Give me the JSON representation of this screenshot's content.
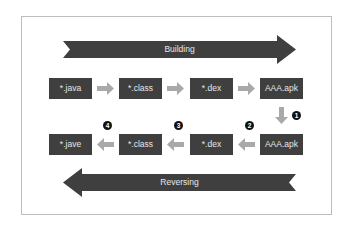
{
  "diagram": {
    "building_label": "Building",
    "reversing_label": "Reversing",
    "build_row": [
      {
        "label": "*.java"
      },
      {
        "label": "*.class"
      },
      {
        "label": "*.dex"
      },
      {
        "label": "AAA.apk"
      }
    ],
    "reverse_row": [
      {
        "label": "*.jave"
      },
      {
        "label": "*.class"
      },
      {
        "label": "*.dex"
      },
      {
        "label": "AAA.apk"
      }
    ],
    "steps": [
      "1",
      "2",
      "3",
      "4"
    ],
    "colors": {
      "box": "#3f3f3f",
      "big_arrow": "#3f3f3f",
      "small_arrow": "#a9a9a9",
      "badge": "#111111",
      "frame_border": "#bdbdbd"
    }
  }
}
